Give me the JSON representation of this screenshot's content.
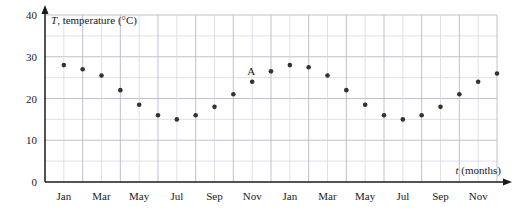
{
  "chart_data": {
    "type": "scatter",
    "title": "",
    "xlabel": "t (months)",
    "ylabel": "T, temperature (°C)",
    "ylabel_symbol": "T",
    "ylabel_rest": ", temperature (°C)",
    "xlabel_symbol": "t",
    "xlabel_rest": " (months)",
    "xlim": [
      0,
      24
    ],
    "ylim": [
      0,
      40
    ],
    "grid": true,
    "grid_major_y": [
      0,
      10,
      20,
      30,
      40
    ],
    "grid_minor_y": [
      5,
      15,
      25,
      35
    ],
    "legend": "none",
    "y_ticks": [
      "0",
      "10",
      "20",
      "30",
      "40"
    ],
    "y_tick_values": [
      0,
      10,
      20,
      30,
      40
    ],
    "x_tick_labels": [
      "Jan",
      "Mar",
      "May",
      "Jul",
      "Sep",
      "Nov",
      "Jan",
      "Mar",
      "May",
      "Jul",
      "Sep",
      "Nov"
    ],
    "x_tick_positions": [
      1,
      3,
      5,
      7,
      9,
      11,
      13,
      15,
      17,
      19,
      21,
      23
    ],
    "x": [
      1,
      2,
      3,
      4,
      5,
      6,
      7,
      8,
      9,
      10,
      11,
      12,
      13,
      14,
      15,
      16,
      17,
      18,
      19,
      20,
      21,
      22,
      23,
      24
    ],
    "values": [
      28,
      27,
      25.5,
      22,
      18.5,
      16,
      15,
      16,
      18,
      21,
      24,
      26.5,
      28,
      27.5,
      25.5,
      22,
      18.5,
      16,
      15,
      16,
      18,
      21,
      24,
      26
    ],
    "annotations": [
      {
        "label": "A",
        "x": 11,
        "y": 24
      }
    ],
    "marker_color": "#333333",
    "axis_color": "#1a1a1a",
    "grid_color": "#b9b9c9",
    "grid_minor_color": "#d8d8e4",
    "background": "#ffffff"
  }
}
